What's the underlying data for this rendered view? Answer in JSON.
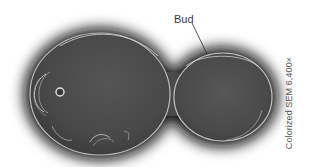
{
  "figure": {
    "labels": {
      "bud": "Bud"
    },
    "caption": "Colorized SEM 6,400×"
  },
  "colors": {
    "background": "#ffffff",
    "halo": "#1a1a1a",
    "cell_fill": "#4a4a4a",
    "cell_highlight": "#cfcfcf",
    "label_text": "#3a3a3a",
    "pointer_line": "#2a2a2a"
  }
}
